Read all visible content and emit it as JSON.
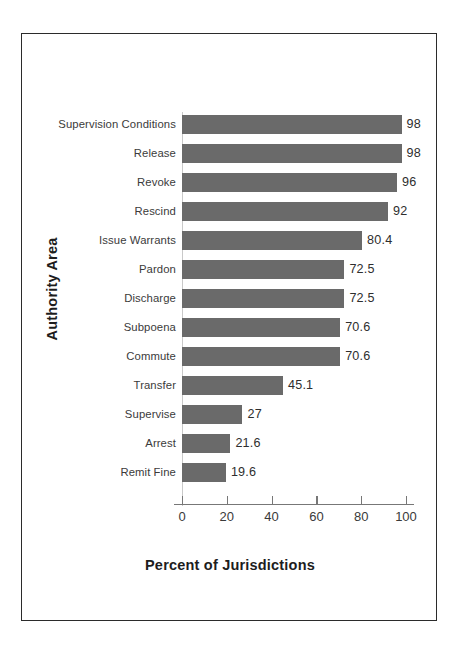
{
  "chart_data": {
    "type": "bar",
    "orientation": "horizontal",
    "title": "",
    "xlabel": "Percent of Jurisdictions",
    "ylabel": "Authority Area",
    "xlim": [
      0,
      100
    ],
    "xticks": [
      0,
      20,
      40,
      60,
      80,
      100
    ],
    "xtick_labels": [
      "0",
      "20",
      "40",
      "60",
      "80",
      "100"
    ],
    "grid": false,
    "legend": null,
    "bar_color": "#6a6a6a",
    "categories": [
      "Supervision Conditions",
      "Release",
      "Revoke",
      "Rescind",
      "Issue Warrants",
      "Pardon",
      "Discharge",
      "Subpoena",
      "Commute",
      "Transfer",
      "Supervise",
      "Arrest",
      "Remit Fine"
    ],
    "values": [
      98,
      98,
      96,
      92,
      80.4,
      72.5,
      72.5,
      70.6,
      70.6,
      45.1,
      27,
      21.6,
      19.6
    ],
    "value_labels": [
      "98",
      "98",
      "96",
      "92",
      "80.4",
      "72.5",
      "72.5",
      "70.6",
      "70.6",
      "45.1",
      "27",
      "21.6",
      "19.6"
    ]
  }
}
